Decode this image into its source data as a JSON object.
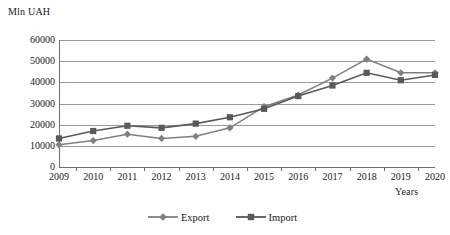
{
  "chart_data": {
    "type": "line",
    "title": "",
    "xlabel": "Years",
    "ylabel": "Mln UAH",
    "categories": [
      "2009",
      "2010",
      "2011",
      "2012",
      "2013",
      "2014",
      "2015",
      "2016",
      "2017",
      "2018",
      "2019",
      "2020"
    ],
    "series": [
      {
        "name": "Export",
        "marker": "diamond",
        "color": "#808080",
        "values": [
          10500,
          12500,
          15500,
          13500,
          14500,
          18500,
          28500,
          34000,
          42000,
          51000,
          44500,
          44500
        ]
      },
      {
        "name": "Import",
        "marker": "square",
        "color": "#595959",
        "values": [
          13500,
          17000,
          19500,
          18500,
          20500,
          23500,
          27500,
          33500,
          38500,
          44500,
          41000,
          43500
        ]
      }
    ],
    "ylim": [
      0,
      60000
    ],
    "yticks": [
      "0",
      "10000",
      "20000",
      "30000",
      "40000",
      "50000",
      "60000"
    ],
    "ytick_values": [
      0,
      10000,
      20000,
      30000,
      40000,
      50000,
      60000
    ],
    "grid": true,
    "legend_position": "bottom-center"
  },
  "axes": {
    "y_axis_title": "Mln UAH",
    "x_axis_title": "Years"
  },
  "legend": {
    "entries": [
      {
        "label": "Export",
        "marker_icon": "diamond-marker-icon"
      },
      {
        "label": "Import",
        "marker_icon": "square-marker-icon"
      }
    ]
  },
  "colors": {
    "export_line": "#808080",
    "import_line": "#595959",
    "gridline": "#9a9a9a",
    "axis": "#6d6d6d",
    "text": "#1a1a1a",
    "background": "#ffffff"
  }
}
